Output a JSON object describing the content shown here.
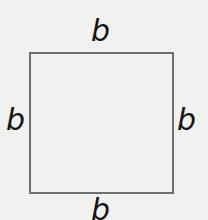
{
  "diagram": {
    "shape": "square",
    "stroke_color": "#6e6e6e",
    "background_color": "#f1f1f0",
    "labels": {
      "top": "b",
      "left": "b",
      "right": "b",
      "bottom": "b"
    }
  }
}
